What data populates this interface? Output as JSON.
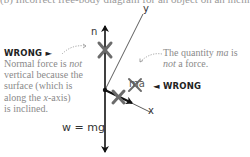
{
  "heading": "(b) Incorrect free-body diagram for an object on an incline",
  "labels": {
    "n": "n",
    "y_axis": "y",
    "x_axis": "x",
    "weight": "w = mg",
    "ma": "ma"
  },
  "annotations": {
    "left": {
      "tag": "WRONG ►",
      "line1_a": "Normal force is ",
      "line1_em": "not",
      "line2": "vertical because the",
      "line3": "surface (which is",
      "line4_a": "along the ",
      "line4_em": "x",
      "line4_b": "-axis)",
      "line5": "is inclined."
    },
    "right": {
      "line1_a": "The quantity ",
      "line1_em": "ma",
      "line1_b": " is",
      "line2_em": "not",
      "line2_b": " a force.",
      "tag": "◄ WRONG"
    }
  },
  "colors": {
    "ink": "#111111",
    "cross": "#6b6b6b",
    "note_text": "#8a8a8a"
  }
}
